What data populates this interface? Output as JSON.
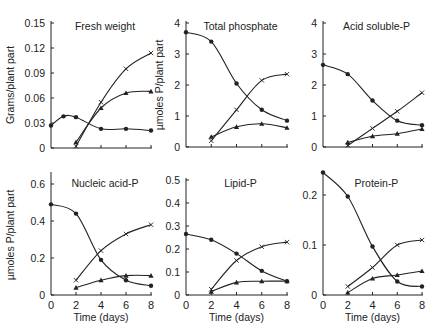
{
  "chart_data": [
    {
      "type": "line",
      "title": "Fresh weight",
      "xlabel": "",
      "ylabel": "Grams/plant part",
      "x": [
        0,
        1,
        2,
        4,
        6,
        8
      ],
      "xlim": [
        0,
        8
      ],
      "ylim": [
        0,
        0.15
      ],
      "yticks": [
        "0",
        "0.03",
        "0.06",
        "0.09",
        "0.12",
        "0.15"
      ],
      "xticks": [],
      "grid": false,
      "panel": {
        "x0": 51,
        "x8": 151,
        "y0": 148,
        "ytop": 23
      },
      "series": [
        {
          "name": "circle",
          "marker": "circle",
          "points": [
            [
              0,
              0.027
            ],
            [
              1,
              0.038
            ],
            [
              2,
              0.037
            ],
            [
              4,
              0.023
            ],
            [
              6,
              0.023
            ],
            [
              8,
              0.021
            ]
          ]
        },
        {
          "name": "cross",
          "marker": "x",
          "points": [
            [
              2,
              0.002
            ],
            [
              4,
              0.055
            ],
            [
              6,
              0.095
            ],
            [
              8,
              0.114
            ]
          ]
        },
        {
          "name": "triangle",
          "marker": "triangle",
          "points": [
            [
              2,
              0.007
            ],
            [
              4,
              0.048
            ],
            [
              6,
              0.066
            ],
            [
              8,
              0.068
            ]
          ]
        }
      ]
    },
    {
      "type": "line",
      "title": "Total phosphate",
      "xlabel": "",
      "ylabel": "µmoles P/plant part",
      "xlim": [
        0,
        8
      ],
      "ylim": [
        0,
        4
      ],
      "yticks": [
        "0",
        "1",
        "2",
        "3",
        "4"
      ],
      "xticks": [],
      "grid": false,
      "panel": {
        "x0": 186,
        "x8": 287,
        "y0": 147,
        "ytop": 23
      },
      "series": [
        {
          "name": "circle",
          "marker": "circle",
          "points": [
            [
              0,
              3.7
            ],
            [
              2,
              3.4
            ],
            [
              4,
              2.05
            ],
            [
              6,
              1.2
            ],
            [
              8,
              0.85
            ]
          ]
        },
        {
          "name": "cross",
          "marker": "x",
          "points": [
            [
              2,
              0.2
            ],
            [
              4,
              1.2
            ],
            [
              6,
              2.15
            ],
            [
              8,
              2.35
            ]
          ]
        },
        {
          "name": "triangle",
          "marker": "triangle",
          "points": [
            [
              2,
              0.33
            ],
            [
              4,
              0.65
            ],
            [
              6,
              0.75
            ],
            [
              8,
              0.62
            ]
          ]
        }
      ]
    },
    {
      "type": "line",
      "title": "Acid soluble-P",
      "xlabel": "",
      "ylabel": "",
      "xlim": [
        0,
        8
      ],
      "ylim": [
        0,
        4
      ],
      "yticks": [
        "0",
        "1",
        "2",
        "3",
        "4"
      ],
      "xticks": [],
      "grid": false,
      "panel": {
        "x0": 323,
        "x8": 422,
        "y0": 147,
        "ytop": 23
      },
      "series": [
        {
          "name": "circle",
          "marker": "circle",
          "points": [
            [
              0,
              2.65
            ],
            [
              2,
              2.35
            ],
            [
              4,
              1.5
            ],
            [
              6,
              0.85
            ],
            [
              8,
              0.7
            ]
          ]
        },
        {
          "name": "cross",
          "marker": "x",
          "points": [
            [
              2,
              0.05
            ],
            [
              4,
              0.6
            ],
            [
              6,
              1.15
            ],
            [
              8,
              1.75
            ]
          ]
        },
        {
          "name": "triangle",
          "marker": "triangle",
          "points": [
            [
              2,
              0.15
            ],
            [
              4,
              0.35
            ],
            [
              6,
              0.43
            ],
            [
              8,
              0.58
            ]
          ]
        }
      ]
    },
    {
      "type": "line",
      "title": "Nucleic acid-P",
      "xlabel": "Time (days)",
      "ylabel": "µmoles P/plant part",
      "xlim": [
        0,
        8
      ],
      "ylim": [
        0,
        0.65
      ],
      "yticks": [
        "0",
        "0.2",
        "0.4",
        "0.6"
      ],
      "xticks": [
        "0",
        "2",
        "4",
        "6",
        "8"
      ],
      "grid": false,
      "panel": {
        "x0": 51,
        "x8": 151,
        "y0": 295,
        "ytop": 175
      },
      "series": [
        {
          "name": "circle",
          "marker": "circle",
          "points": [
            [
              0,
              0.49
            ],
            [
              2,
              0.44
            ],
            [
              4,
              0.19
            ],
            [
              6,
              0.08
            ],
            [
              8,
              0.05
            ]
          ]
        },
        {
          "name": "cross",
          "marker": "x",
          "points": [
            [
              2,
              0.08
            ],
            [
              4,
              0.24
            ],
            [
              6,
              0.33
            ],
            [
              8,
              0.38
            ]
          ]
        },
        {
          "name": "triangle",
          "marker": "triangle",
          "points": [
            [
              2,
              0.04
            ],
            [
              4,
              0.08
            ],
            [
              6,
              0.105
            ],
            [
              8,
              0.105
            ]
          ]
        }
      ]
    },
    {
      "type": "line",
      "title": "Lipid-P",
      "xlabel": "Time (days)",
      "ylabel": "",
      "xlim": [
        0,
        8
      ],
      "ylim": [
        0,
        0.5
      ],
      "yticks": [
        "0",
        "0.1",
        "0.2",
        "0.3",
        "0.4",
        "0.5"
      ],
      "xticks": [
        "0",
        "2",
        "4",
        "6",
        "8"
      ],
      "grid": false,
      "panel": {
        "x0": 186,
        "x8": 287,
        "y0": 295,
        "ytop": 180
      },
      "series": [
        {
          "name": "circle",
          "marker": "circle",
          "points": [
            [
              0,
              0.265
            ],
            [
              2,
              0.24
            ],
            [
              4,
              0.18
            ],
            [
              6,
              0.105
            ],
            [
              8,
              0.06
            ]
          ]
        },
        {
          "name": "cross",
          "marker": "x",
          "points": [
            [
              2,
              0.025
            ],
            [
              4,
              0.15
            ],
            [
              6,
              0.21
            ],
            [
              8,
              0.23
            ]
          ]
        },
        {
          "name": "triangle",
          "marker": "triangle",
          "points": [
            [
              2,
              0.015
            ],
            [
              4,
              0.055
            ],
            [
              6,
              0.06
            ],
            [
              8,
              0.06
            ]
          ]
        }
      ]
    },
    {
      "type": "line",
      "title": "Protein-P",
      "xlabel": "Time (days)",
      "ylabel": "",
      "xlim": [
        0,
        8
      ],
      "ylim": [
        0,
        0.25
      ],
      "yticks": [
        "0",
        "0.1",
        "0.2"
      ],
      "xticks": [
        "0",
        "2",
        "4",
        "6",
        "8"
      ],
      "grid": false,
      "panel": {
        "x0": 323,
        "x8": 422,
        "y0": 295,
        "ytop": 170
      },
      "series": [
        {
          "name": "circle",
          "marker": "circle",
          "points": [
            [
              0,
              0.245
            ],
            [
              2,
              0.197
            ],
            [
              4,
              0.097
            ],
            [
              6,
              0.027
            ],
            [
              8,
              0.017
            ]
          ]
        },
        {
          "name": "cross",
          "marker": "x",
          "points": [
            [
              2,
              0.017
            ],
            [
              4,
              0.055
            ],
            [
              6,
              0.1
            ],
            [
              8,
              0.11
            ]
          ]
        },
        {
          "name": "triangle",
          "marker": "triangle",
          "points": [
            [
              2,
              0.005
            ],
            [
              4,
              0.033
            ],
            [
              6,
              0.04
            ],
            [
              8,
              0.048
            ]
          ]
        }
      ]
    }
  ],
  "colors": {
    "ink": "#222222",
    "background": "#ffffff"
  }
}
